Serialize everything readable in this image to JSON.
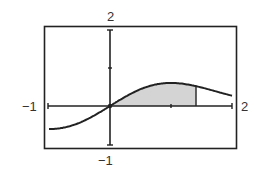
{
  "chart_data": {
    "type": "area",
    "title": "",
    "xlabel": "",
    "ylabel": "",
    "xlim": [
      -1,
      2
    ],
    "ylim": [
      -1,
      2
    ],
    "grid": false,
    "legend": null,
    "function_description": "y = x·e^(-x²/2) (approximate reading)",
    "series": [
      {
        "name": "curve",
        "x": [
          -1,
          -0.75,
          -0.5,
          -0.25,
          0,
          0.25,
          0.5,
          0.75,
          1,
          1.25,
          1.5,
          1.75,
          2
        ],
        "y": [
          -0.61,
          -0.57,
          -0.44,
          -0.24,
          0,
          0.24,
          0.44,
          0.57,
          0.61,
          0.57,
          0.49,
          0.38,
          0.27
        ]
      }
    ],
    "shaded_region": {
      "from_x": 0,
      "to_x": 1.41,
      "description": "area under curve between x=0 and vertical line"
    },
    "x_ticks": [
      -1,
      0,
      1,
      2
    ],
    "y_ticks": [
      -1,
      0,
      1,
      2
    ]
  },
  "labels": {
    "y_max": "2",
    "y_min": "−1",
    "x_min": "−1",
    "x_max": "2"
  },
  "colors": {
    "line": "#222222",
    "shade": "#d4d4d4",
    "frame": "#222222"
  }
}
